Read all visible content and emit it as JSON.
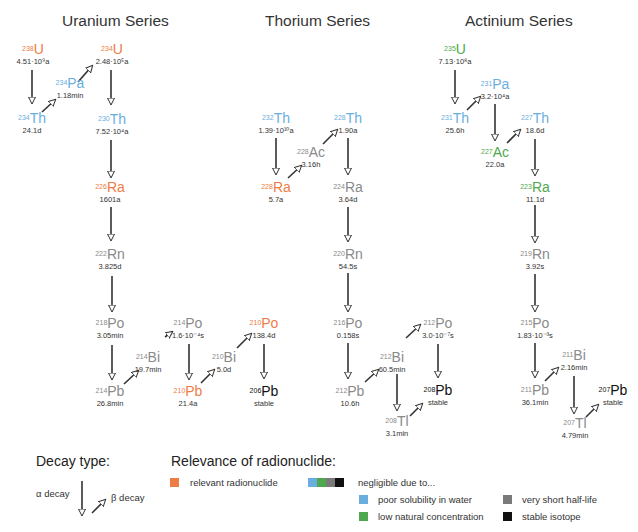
{
  "colors": {
    "relevant": "#ee7c45",
    "poor_solubility": "#6aaee0",
    "low_concentration": "#4fa84f",
    "short_half_life": "#7a7a7a",
    "stable": "#111111"
  },
  "series": [
    {
      "title": "Uranium Series",
      "nuclides": [
        {
          "mass": "238",
          "sym": "U",
          "hl": "4.51·10⁹a",
          "cat": "relevant"
        },
        {
          "mass": "234",
          "sym": "Th",
          "hl": "24.1d",
          "cat": "poor"
        },
        {
          "mass": "234",
          "sym": "Pa",
          "hl": "1.18min",
          "cat": "poor"
        },
        {
          "mass": "234",
          "sym": "U",
          "hl": "2.48·10⁵a",
          "cat": "relevant"
        },
        {
          "mass": "230",
          "sym": "Th",
          "hl": "7.52·10⁴a",
          "cat": "poor"
        },
        {
          "mass": "226",
          "sym": "Ra",
          "hl": "1601a",
          "cat": "relevant"
        },
        {
          "mass": "222",
          "sym": "Rn",
          "hl": "3.825d",
          "cat": "short"
        },
        {
          "mass": "218",
          "sym": "Po",
          "hl": "3.05min",
          "cat": "short"
        },
        {
          "mass": "214",
          "sym": "Pb",
          "hl": "26.8min",
          "cat": "short"
        },
        {
          "mass": "214",
          "sym": "Bi",
          "hl": "19.7min",
          "cat": "short"
        },
        {
          "mass": "214",
          "sym": "Po",
          "hl": "1.6·10⁻⁴s",
          "cat": "short"
        },
        {
          "mass": "210",
          "sym": "Pb",
          "hl": "21.4a",
          "cat": "relevant"
        },
        {
          "mass": "210",
          "sym": "Bi",
          "hl": "5.0d",
          "cat": "short"
        },
        {
          "mass": "210",
          "sym": "Po",
          "hl": "138.4d",
          "cat": "relevant"
        },
        {
          "mass": "206",
          "sym": "Pb",
          "hl": "stable",
          "cat": "stable"
        }
      ]
    },
    {
      "title": "Thorium Series",
      "nuclides": [
        {
          "mass": "232",
          "sym": "Th",
          "hl": "1.39·10¹⁰a",
          "cat": "poor"
        },
        {
          "mass": "228",
          "sym": "Ra",
          "hl": "5.7a",
          "cat": "relevant"
        },
        {
          "mass": "228",
          "sym": "Ac",
          "hl": "3.16h",
          "cat": "short"
        },
        {
          "mass": "228",
          "sym": "Th",
          "hl": "1.90a",
          "cat": "poor"
        },
        {
          "mass": "224",
          "sym": "Ra",
          "hl": "3.64d",
          "cat": "short"
        },
        {
          "mass": "220",
          "sym": "Rn",
          "hl": "54.5s",
          "cat": "short"
        },
        {
          "mass": "216",
          "sym": "Po",
          "hl": "0.158s",
          "cat": "short"
        },
        {
          "mass": "212",
          "sym": "Pb",
          "hl": "10.6h",
          "cat": "short"
        },
        {
          "mass": "212",
          "sym": "Bi",
          "hl": "60.5min",
          "cat": "short"
        },
        {
          "mass": "212",
          "sym": "Po",
          "hl": "3.0·10⁻⁷s",
          "cat": "short"
        },
        {
          "mass": "208",
          "sym": "Tl",
          "hl": "3.1min",
          "cat": "short"
        },
        {
          "mass": "208",
          "sym": "Pb",
          "hl": "stable",
          "cat": "stable"
        }
      ]
    },
    {
      "title": "Actinium Series",
      "nuclides": [
        {
          "mass": "235",
          "sym": "U",
          "hl": "7.13·10⁸a",
          "cat": "low"
        },
        {
          "mass": "231",
          "sym": "Th",
          "hl": "25.6h",
          "cat": "poor"
        },
        {
          "mass": "231",
          "sym": "Pa",
          "hl": "3.2·10⁴a",
          "cat": "poor"
        },
        {
          "mass": "227",
          "sym": "Ac",
          "hl": "22.0a",
          "cat": "low"
        },
        {
          "mass": "227",
          "sym": "Th",
          "hl": "18.6d",
          "cat": "poor"
        },
        {
          "mass": "223",
          "sym": "Ra",
          "hl": "11.1d",
          "cat": "low"
        },
        {
          "mass": "219",
          "sym": "Rn",
          "hl": "3.92s",
          "cat": "short"
        },
        {
          "mass": "215",
          "sym": "Po",
          "hl": "1.83·10⁻³s",
          "cat": "short"
        },
        {
          "mass": "211",
          "sym": "Pb",
          "hl": "36.1min",
          "cat": "short"
        },
        {
          "mass": "211",
          "sym": "Bi",
          "hl": "2.16min",
          "cat": "short"
        },
        {
          "mass": "207",
          "sym": "Tl",
          "hl": "4.79min",
          "cat": "short"
        },
        {
          "mass": "207",
          "sym": "Pb",
          "hl": "stable",
          "cat": "stable"
        }
      ]
    }
  ],
  "legend": {
    "decay_title": "Decay type:",
    "alpha_label": "α decay",
    "beta_label": "β decay",
    "relevance_title": "Relevance of radionuclide:",
    "relevant_label": "relevant radionuclide",
    "negligible_label": "negligible due to...",
    "poor_label": "poor solubility in water",
    "low_label": "low natural concentration",
    "short_label": "very short half-life",
    "stable_label": "stable isotope"
  }
}
